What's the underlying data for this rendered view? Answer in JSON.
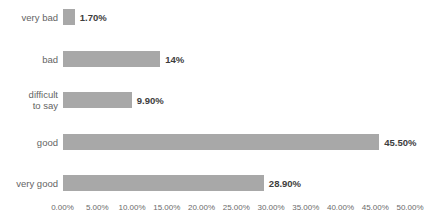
{
  "chart_data": {
    "type": "bar",
    "orientation": "horizontal",
    "title": "",
    "xlabel": "",
    "ylabel": "",
    "categories": [
      "very bad",
      "bad",
      "difficult to say",
      "good",
      "very good"
    ],
    "category_display": [
      "very bad",
      "bad",
      "difficult\nto say",
      "good",
      "very good"
    ],
    "values": [
      1.7,
      14,
      9.9,
      45.5,
      28.9
    ],
    "value_labels": [
      "1.70%",
      "14%",
      "9.90%",
      "45.50%",
      "28.90%"
    ],
    "xlim": [
      0,
      50
    ],
    "x_tick_values": [
      0,
      5,
      10,
      15,
      20,
      25,
      30,
      35,
      40,
      45,
      50
    ],
    "x_ticks": [
      "0.00%",
      "5.00%",
      "10.00%",
      "15.00%",
      "20.00%",
      "25.00%",
      "30.00%",
      "35.00%",
      "40.00%",
      "45.00%",
      "50.00%"
    ],
    "grid": false,
    "legend": "none",
    "colors": {
      "bar": "#a8a8a8",
      "category_label": "#646464",
      "value_label": "#3d3d3d",
      "axis_label": "#6b6b6b",
      "background": "#ffffff"
    }
  }
}
